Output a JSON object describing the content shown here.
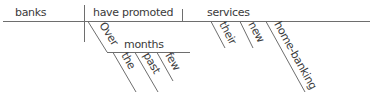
{
  "diagram": {
    "type": "sentence-diagram",
    "subject": "banks",
    "verb": "have promoted",
    "direct_object": "services",
    "object_modifiers": [
      "their",
      "new",
      "home-banking"
    ],
    "prepositional_phrase": {
      "preposition": "Over",
      "object": "months",
      "modifiers": [
        "the",
        "past",
        "few"
      ]
    },
    "colors": {
      "line": "#6e6e6e",
      "text": "#3a3a3a"
    }
  }
}
